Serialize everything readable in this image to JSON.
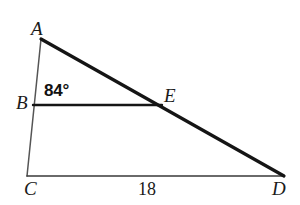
{
  "figure": {
    "type": "geometry-diagram",
    "background_color": "#ffffff",
    "stroke_color": "#1a1a1a",
    "thin_stroke_color": "#4a4a4a"
  },
  "points": {
    "A": {
      "label": "A",
      "x": 41,
      "y": 39
    },
    "B": {
      "label": "B",
      "x": 33,
      "y": 105
    },
    "C": {
      "label": "C",
      "x": 27,
      "y": 176
    },
    "D": {
      "label": "D",
      "x": 283,
      "y": 176
    },
    "E": {
      "label": "E",
      "x": 161,
      "y": 105
    }
  },
  "segments": [
    {
      "name": "A-to-D",
      "from": "A",
      "to": "D",
      "width": 3.2,
      "color": "#151515"
    },
    {
      "name": "A-to-C",
      "from": "A",
      "to": "C",
      "width": 1.5,
      "color": "#555555"
    },
    {
      "name": "C-to-D",
      "from": "C",
      "to": "D",
      "width": 1.6,
      "color": "#3a3a3a"
    },
    {
      "name": "B-to-E",
      "from": "B",
      "to": "E",
      "width": 2.4,
      "color": "#151515"
    }
  ],
  "annotations": {
    "angle_at_B": "84°",
    "side_CD_length": "18"
  }
}
